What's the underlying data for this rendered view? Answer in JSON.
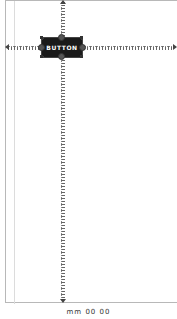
{
  "editor": {
    "widget": {
      "type": "button",
      "label": "BUTTON"
    },
    "constraints": {
      "top": "spring",
      "bottom": "spring",
      "left": "spring",
      "right": "spring"
    },
    "footer_label": "mm 00 00",
    "colors": {
      "button_bg": "#1a1a1a",
      "button_text": "#ffffff",
      "canvas_border": "#b8b8b8",
      "spring": "#666666"
    }
  }
}
